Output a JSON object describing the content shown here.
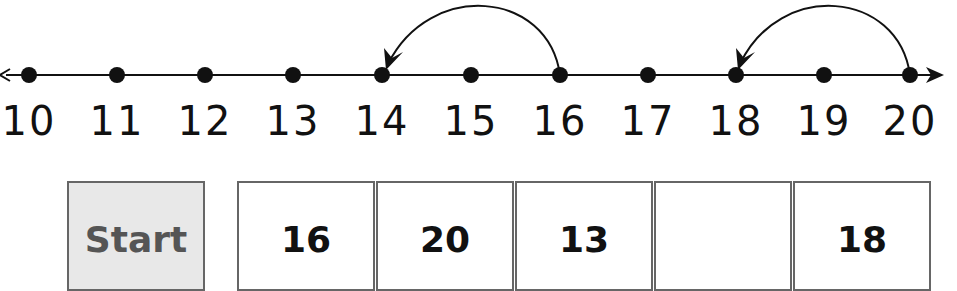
{
  "number_line": {
    "min": 10,
    "max": 20,
    "ticks": [
      "10",
      "11",
      "12",
      "13",
      "14",
      "15",
      "16",
      "17",
      "18",
      "19",
      "20"
    ],
    "jumps": [
      {
        "from": 16,
        "to": 14
      },
      {
        "from": 20,
        "to": 18
      }
    ]
  },
  "sequence": {
    "boxes": [
      {
        "label": "Start",
        "shaded": true
      },
      {
        "label": "16"
      },
      {
        "label": "20"
      },
      {
        "label": "13"
      },
      {
        "label": ""
      },
      {
        "label": "18"
      }
    ]
  },
  "colors": {
    "line": "#111111",
    "box_border": "#666666",
    "start_fill": "#e8e8e8"
  }
}
